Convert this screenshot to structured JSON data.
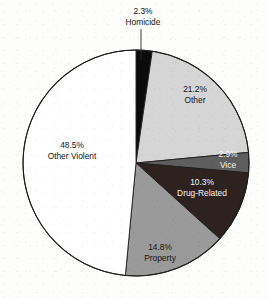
{
  "chart_data": {
    "type": "pie",
    "title": "",
    "subtitle": "",
    "xlabel": "",
    "ylabel": "",
    "legend_position": "none",
    "grid": false,
    "start_angle_deg": 0,
    "direction": "clockwise",
    "center": {
      "x": 136,
      "y": 163
    },
    "radius": 113,
    "categories": [
      "Homicide",
      "Other",
      "Vice",
      "Drug-Related",
      "Property",
      "Other Violent"
    ],
    "values": [
      2.3,
      21.2,
      2.9,
      10.3,
      14.8,
      48.5
    ],
    "value_suffix": "%",
    "slices": [
      {
        "name": "Homicide",
        "value": 2.3,
        "value_text": "2.3%",
        "label": "Homicide",
        "color": "#0b0b0b",
        "label_color": "#141414",
        "label_placement": "outside",
        "label_x": 143,
        "label_y": 14,
        "value_y": 14,
        "name_y": 25,
        "leader_x1": 141,
        "leader_y1": 29,
        "leader_x2": 141,
        "leader_y2": 60
      },
      {
        "name": "Other",
        "value": 21.2,
        "value_text": "21.2%",
        "label": "Other",
        "color": "#d5d5d5",
        "label_color": "#141414",
        "label_placement": "inside",
        "label_x": 195,
        "value_y": 90,
        "name_y": 101
      },
      {
        "name": "Vice",
        "value": 2.9,
        "value_text": "2.9%",
        "label": "Vice",
        "color": "#5e5e5e",
        "label_color": "#f4f4f4",
        "label_placement": "inside",
        "label_x": 228,
        "value_y": 155,
        "name_y": 166
      },
      {
        "name": "Drug-Related",
        "value": 10.3,
        "value_text": "10.3%",
        "label": "Drug-Related",
        "color": "#2e2220",
        "label_color": "#f4f4f4",
        "label_placement": "inside",
        "label_x": 202,
        "value_y": 183,
        "name_y": 194
      },
      {
        "name": "Property",
        "value": 14.8,
        "value_text": "14.8%",
        "label": "Property",
        "color": "#9a9a9a",
        "label_color": "#141414",
        "label_placement": "inside",
        "label_x": 160,
        "value_y": 248,
        "name_y": 259
      },
      {
        "name": "Other Violent",
        "value": 48.5,
        "value_text": "48.5%",
        "label": "Other Violent",
        "color": "#ffffff",
        "label_color": "#141414",
        "label_placement": "inside",
        "label_x": 72,
        "value_y": 146,
        "name_y": 157
      }
    ]
  }
}
